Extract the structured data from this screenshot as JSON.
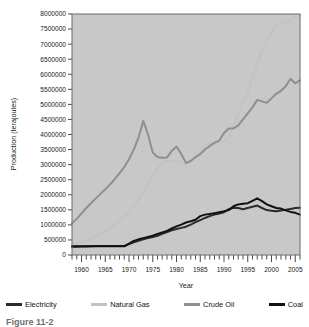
{
  "figure": {
    "caption": "Figure 11-2"
  },
  "legend": {
    "items": [
      {
        "label": "Electricity",
        "color": "#2b2b2b"
      },
      {
        "label": "Natural Gas",
        "color": "#c3c3c3"
      },
      {
        "label": "Crude Oil",
        "color": "#8f8f8f"
      },
      {
        "label": "Coal",
        "color": "#111111"
      }
    ]
  },
  "chart_data": {
    "type": "line",
    "title": "",
    "xlabel": "Year",
    "ylabel": "Production (terajoules)",
    "xlim": [
      1958,
      2006
    ],
    "ylim": [
      0,
      8000000
    ],
    "grid": false,
    "legend_position": "bottom",
    "plot_background": "#c8c8c8",
    "page_background": "#ffffff",
    "y_ticks": [
      0,
      500000,
      1000000,
      1500000,
      2000000,
      2500000,
      3000000,
      3500000,
      4000000,
      4500000,
      5000000,
      5500000,
      6000000,
      6500000,
      7000000,
      7500000,
      8000000
    ],
    "y_tick_labels": [
      "0",
      "500000",
      "1000000",
      "1500000",
      "2000000",
      "2500000",
      "3000000",
      "3500000",
      "4000000",
      "4500000",
      "5000000",
      "5500000",
      "6000000",
      "6500000",
      "7000000",
      "7500000",
      "8000000"
    ],
    "x_major_ticks": [
      1960,
      1965,
      1970,
      1975,
      1980,
      1985,
      1990,
      1995,
      2000,
      2005
    ],
    "x_major_tick_labels": [
      "1960",
      "1965",
      "1970",
      "1975",
      "1980",
      "1985",
      "1990",
      "1995",
      "2000",
      "2005"
    ],
    "x_minor_tick_interval": 1,
    "x": [
      1958,
      1959,
      1960,
      1961,
      1962,
      1963,
      1964,
      1965,
      1966,
      1967,
      1968,
      1969,
      1970,
      1971,
      1972,
      1973,
      1974,
      1975,
      1976,
      1977,
      1978,
      1979,
      1980,
      1981,
      1982,
      1983,
      1984,
      1985,
      1986,
      1987,
      1988,
      1989,
      1990,
      1991,
      1992,
      1993,
      1994,
      1995,
      1996,
      1997,
      1998,
      1999,
      2000,
      2001,
      2002,
      2003,
      2004,
      2005,
      2006
    ],
    "series": [
      {
        "name": "Electricity",
        "color": "#2b2b2b",
        "values": [
          270000,
          275000,
          280000,
          285000,
          290000,
          295000,
          300000,
          300000,
          300000,
          300000,
          300000,
          300000,
          360000,
          420000,
          470000,
          520000,
          560000,
          600000,
          640000,
          700000,
          760000,
          820000,
          860000,
          900000,
          940000,
          1010000,
          1090000,
          1160000,
          1230000,
          1290000,
          1340000,
          1380000,
          1420000,
          1520000,
          1570000,
          1560000,
          1520000,
          1560000,
          1600000,
          1640000,
          1560000,
          1490000,
          1470000,
          1450000,
          1480000,
          1500000,
          1530000,
          1560000,
          1570000
        ]
      },
      {
        "name": "Natural Gas",
        "color": "#c3c3c3",
        "values": [
          350000,
          380000,
          420000,
          470000,
          540000,
          620000,
          700000,
          800000,
          900000,
          1010000,
          1130000,
          1270000,
          1430000,
          1620000,
          1840000,
          2080000,
          2350000,
          2640000,
          2880000,
          3050000,
          3100000,
          3120000,
          3110000,
          3080000,
          3060000,
          3120000,
          3250000,
          3420000,
          3620000,
          3720000,
          3760000,
          3770000,
          3780000,
          3900000,
          4300000,
          4700000,
          5050000,
          5400000,
          5900000,
          6350000,
          6800000,
          7100000,
          7400000,
          7650000,
          7700000,
          7720000,
          7800000,
          7900000,
          7950000
        ]
      },
      {
        "name": "Crude Oil",
        "color": "#8f8f8f",
        "values": [
          1050000,
          1200000,
          1380000,
          1560000,
          1720000,
          1880000,
          2030000,
          2180000,
          2340000,
          2520000,
          2720000,
          2920000,
          3180000,
          3500000,
          3900000,
          4450000,
          4000000,
          3400000,
          3250000,
          3230000,
          3240000,
          3450000,
          3600000,
          3350000,
          3050000,
          3120000,
          3250000,
          3350000,
          3500000,
          3620000,
          3720000,
          3800000,
          4050000,
          4200000,
          4200000,
          4300000,
          4500000,
          4700000,
          4900000,
          5150000,
          5100000,
          5050000,
          5200000,
          5350000,
          5450000,
          5600000,
          5850000,
          5700000,
          5800000
        ]
      },
      {
        "name": "Coal",
        "color": "#111111",
        "values": [
          290000,
          290000,
          290000,
          290000,
          290000,
          290000,
          290000,
          290000,
          290000,
          290000,
          290000,
          290000,
          380000,
          470000,
          520000,
          560000,
          600000,
          640000,
          700000,
          750000,
          800000,
          880000,
          950000,
          1010000,
          1080000,
          1120000,
          1170000,
          1290000,
          1340000,
          1360000,
          1390000,
          1420000,
          1450000,
          1490000,
          1620000,
          1680000,
          1700000,
          1720000,
          1800000,
          1880000,
          1790000,
          1680000,
          1620000,
          1560000,
          1540000,
          1480000,
          1430000,
          1400000,
          1340000
        ]
      }
    ]
  }
}
